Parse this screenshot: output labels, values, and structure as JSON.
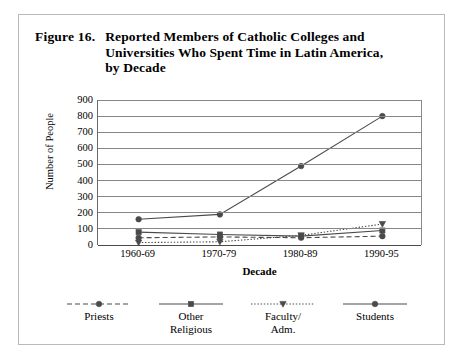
{
  "figure": {
    "number": "Figure 16.",
    "title": "Reported Members of Catholic Colleges and Universities Who Spent Time in Latin America, by Decade"
  },
  "chart_data": {
    "type": "line",
    "title": "Reported Members of Catholic Colleges and Universities Who Spent Time in Latin America, by Decade",
    "xlabel": "Decade",
    "ylabel": "Number of People",
    "categories": [
      "1960-69",
      "1970-79",
      "1980-89",
      "1990-95"
    ],
    "ylim": [
      0,
      900
    ],
    "ytick_step": 100,
    "yticks": [
      "900",
      "800",
      "700",
      "600",
      "500",
      "400",
      "300",
      "200",
      "100",
      "0"
    ],
    "grid": true,
    "legend_position": "bottom",
    "series": [
      {
        "name": "Priests",
        "values": [
          45,
          50,
          45,
          55
        ],
        "line_style": "dashed",
        "marker": "circle",
        "color": "#4a4a4a"
      },
      {
        "name": "Other\nReligious",
        "values": [
          80,
          65,
          55,
          90
        ],
        "line_style": "solid",
        "marker": "square",
        "color": "#4a4a4a"
      },
      {
        "name": "Faculty/\nAdm.",
        "values": [
          15,
          20,
          60,
          130
        ],
        "line_style": "dotted",
        "marker": "triangle",
        "color": "#4a4a4a"
      },
      {
        "name": "Students",
        "values": [
          160,
          190,
          490,
          800
        ],
        "line_style": "solid",
        "marker": "circle",
        "color": "#4a4a4a"
      }
    ]
  }
}
